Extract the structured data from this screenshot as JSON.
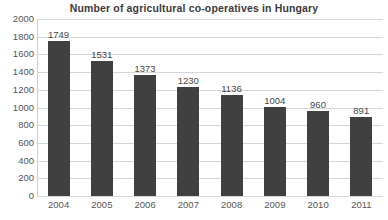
{
  "chart_data": {
    "type": "bar",
    "title": "Number of agricultural co-operatives in Hungary",
    "xlabel": "",
    "ylabel": "",
    "categories": [
      "2004",
      "2005",
      "2006",
      "2007",
      "2008",
      "2009",
      "2010",
      "2011"
    ],
    "values": [
      1749,
      1531,
      1373,
      1230,
      1136,
      1004,
      960,
      891
    ],
    "data_labels": [
      "1749",
      "1531",
      "1373",
      "1230",
      "1136",
      "1004",
      "960",
      "891"
    ],
    "ylim": [
      0,
      2000
    ],
    "ytick_step": 200,
    "ytick_labels": [
      "2000",
      "1800",
      "1600",
      "1400",
      "1200",
      "1000",
      "800",
      "600",
      "400",
      "200",
      "0"
    ],
    "grid": true,
    "grid_axis": "y",
    "legend": false,
    "legend_position": "none",
    "series": [
      {
        "name": "Number of agricultural co-operatives",
        "values": [
          1749,
          1531,
          1373,
          1230,
          1136,
          1004,
          960,
          891
        ]
      }
    ],
    "colors": {
      "bar": "#404040",
      "gridline": "#d6d6d6",
      "axis": "#d0d0d0",
      "title_text": "#3b3b3b",
      "tick_text": "#555555",
      "label_text": "#4a4a4a",
      "background": "#ffffff"
    }
  }
}
